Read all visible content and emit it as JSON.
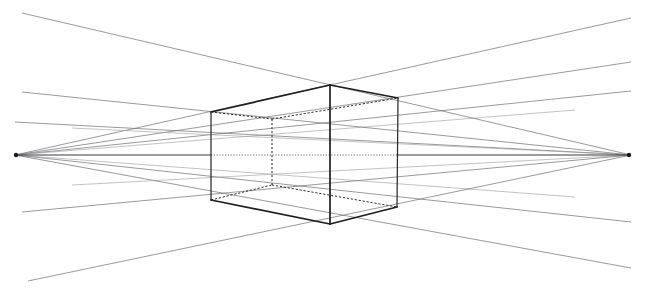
{
  "figure": {
    "type": "technical-line-drawing",
    "canvas": {
      "width": 649,
      "height": 298
    },
    "background_color": "#ffffff",
    "line_color_construction": "#6e6e72",
    "line_color_box": "#1e1e22",
    "line_color_hidden": "#2e2e33",
    "horizon_color": "#3a3a3e"
  },
  "geometry": {
    "vanishing_points": [
      {
        "name": "left-vanishing-point",
        "label": "VPL",
        "x": 15,
        "y": 155
      },
      {
        "name": "right-vanishing-point",
        "label": "VPR",
        "x": 631,
        "y": 155
      }
    ],
    "horizon": {
      "name": "horizon-line",
      "y": 155,
      "x_start": 15,
      "x_end": 631,
      "solid_segments": [
        [
          15,
          211
        ],
        [
          398,
          631
        ]
      ],
      "dotted_segments": [
        [
          211,
          398
        ]
      ]
    },
    "box_vertices": {
      "front_top": {
        "x": 330,
        "y": 85
      },
      "front_bottom": {
        "x": 330,
        "y": 224
      },
      "left_top": {
        "x": 211,
        "y": 112
      },
      "left_bottom": {
        "x": 211,
        "y": 200
      },
      "right_top": {
        "x": 398,
        "y": 98
      },
      "right_bottom": {
        "x": 397,
        "y": 207
      },
      "back_top": {
        "x": 272,
        "y": 119
      },
      "back_bottom": {
        "x": 272,
        "y": 185
      }
    },
    "box_visible_edges": [
      {
        "name": "edge-front-vertical",
        "from": "front_top",
        "to": "front_bottom"
      },
      {
        "name": "edge-left-vertical",
        "from": "left_top",
        "to": "left_bottom"
      },
      {
        "name": "edge-right-vertical",
        "from": "right_top",
        "to": "right_bottom"
      },
      {
        "name": "edge-top-left-face",
        "from": "left_top",
        "to": "front_top"
      },
      {
        "name": "edge-top-right-face",
        "from": "front_top",
        "to": "right_top"
      },
      {
        "name": "edge-bottom-left-face",
        "from": "left_bottom",
        "to": "front_bottom"
      },
      {
        "name": "edge-bottom-right-face",
        "from": "front_bottom",
        "to": "right_bottom"
      }
    ],
    "box_hidden_edges": [
      {
        "name": "hidden-edge-back-vertical",
        "from": "back_top",
        "to": "back_bottom"
      },
      {
        "name": "hidden-edge-back-top-left",
        "from": "left_top",
        "to": "back_top"
      },
      {
        "name": "hidden-edge-back-top-right",
        "from": "back_top",
        "to": "right_top"
      },
      {
        "name": "hidden-edge-back-bottom-left",
        "from": "left_bottom",
        "to": "back_bottom"
      },
      {
        "name": "hidden-edge-back-bottom-right",
        "from": "back_bottom",
        "to": "right_bottom"
      }
    ],
    "construction_rays_from_left_vp": [
      {
        "name": "ray-left-vp-upper-far",
        "x2": 631,
        "y2": 18
      },
      {
        "name": "ray-left-vp-upper-near",
        "x2": 631,
        "y2": 62
      },
      {
        "name": "ray-left-vp-to-top-right-corner",
        "x2": 631,
        "y2": 91
      },
      {
        "name": "ray-left-vp-to-box-top",
        "x2": 570,
        "y2": 110
      },
      {
        "name": "ray-left-vp-to-box-bottom",
        "x2": 570,
        "y2": 196
      },
      {
        "name": "ray-left-vp-lower-near",
        "x2": 631,
        "y2": 222
      },
      {
        "name": "ray-left-vp-lower-far",
        "x2": 631,
        "y2": 268
      }
    ],
    "construction_rays_from_right_vp": [
      {
        "name": "ray-right-vp-upper-far",
        "x2": 22,
        "y2": 13
      },
      {
        "name": "ray-right-vp-upper-near",
        "x2": 22,
        "y2": 92
      },
      {
        "name": "ray-right-vp-to-top-left-corner",
        "x2": 15,
        "y2": 122
      },
      {
        "name": "ray-right-vp-to-box-top",
        "x2": 78,
        "y2": 128
      },
      {
        "name": "ray-right-vp-to-box-bottom",
        "x2": 78,
        "y2": 184
      },
      {
        "name": "ray-right-vp-lower-near",
        "x2": 22,
        "y2": 212
      },
      {
        "name": "ray-right-vp-lower-far",
        "x2": 28,
        "y2": 280
      }
    ]
  },
  "labels": {
    "drawing_name": "Two-Point Perspective Box Construction",
    "left_vp_name": "Left Vanishing Point",
    "right_vp_name": "Right Vanishing Point",
    "horizon_name": "Horizon Line",
    "box_name": "Rectangular Box"
  }
}
